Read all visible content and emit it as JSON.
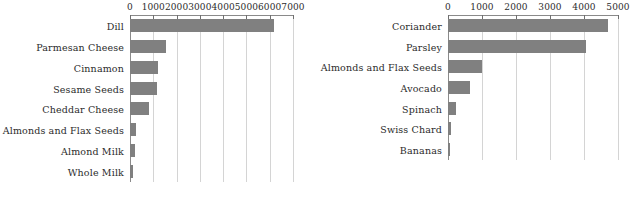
{
  "chart_data": [
    {
      "type": "bar",
      "orientation": "horizontal",
      "panel": "left",
      "title": "",
      "xlabel": "",
      "ylabel": "",
      "xlim": [
        0,
        7000
      ],
      "xticks": [
        0,
        1000,
        2000,
        3000,
        4000,
        5000,
        6000,
        7000
      ],
      "xticklabels": [
        "0",
        "1000",
        "2000",
        "3000",
        "4000",
        "5000",
        "6000",
        "7000"
      ],
      "grid": true,
      "grid_axis": "x",
      "legend": false,
      "bar_color": "#808080",
      "categories": [
        "Dill",
        "Parmesan Cheese",
        "Cinnamon",
        "Sesame Seeds",
        "Cheddar Cheese",
        "Almonds and Flax Seeds",
        "Almond Milk",
        "Whole Milk"
      ],
      "values": [
        6200,
        1550,
        1200,
        1150,
        800,
        250,
        230,
        110
      ]
    },
    {
      "type": "bar",
      "orientation": "horizontal",
      "panel": "right",
      "title": "",
      "xlabel": "",
      "ylabel": "",
      "xlim": [
        0,
        5000
      ],
      "xticks": [
        0,
        1000,
        2000,
        3000,
        4000,
        5000
      ],
      "xticklabels": [
        "0",
        "1000",
        "2000",
        "3000",
        "4000",
        "5000"
      ],
      "grid": true,
      "grid_axis": "x",
      "legend": false,
      "bar_color": "#808080",
      "categories": [
        "Coriander",
        "Parsley",
        "Almonds and Flax Seeds",
        "Avocado",
        "Spinach",
        "Swiss Chard",
        "Bananas"
      ],
      "values": [
        4700,
        4050,
        1000,
        650,
        230,
        90,
        60
      ]
    }
  ]
}
